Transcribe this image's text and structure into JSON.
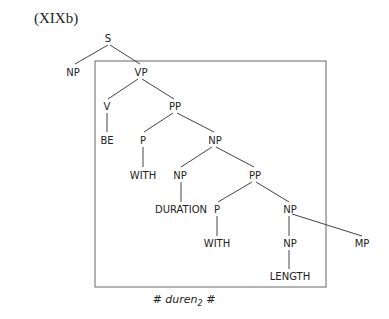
{
  "figure": {
    "label": "(XIXb)",
    "caption": {
      "prefix": "# duren",
      "subscript": "2",
      "suffix": " #"
    }
  },
  "tree": {
    "nodes": [
      {
        "id": "s",
        "label": "S"
      },
      {
        "id": "np1",
        "label": "NP"
      },
      {
        "id": "vp",
        "label": "VP"
      },
      {
        "id": "v",
        "label": "V"
      },
      {
        "id": "pp1",
        "label": "PP"
      },
      {
        "id": "be",
        "label": "BE"
      },
      {
        "id": "p1",
        "label": "P"
      },
      {
        "id": "np2",
        "label": "NP"
      },
      {
        "id": "with1",
        "label": "WITH"
      },
      {
        "id": "np3",
        "label": "NP"
      },
      {
        "id": "pp2",
        "label": "PP"
      },
      {
        "id": "duration",
        "label": "DURATION"
      },
      {
        "id": "p2",
        "label": "P"
      },
      {
        "id": "np4",
        "label": "NP"
      },
      {
        "id": "with2",
        "label": "WITH"
      },
      {
        "id": "np5",
        "label": "NP"
      },
      {
        "id": "mp",
        "label": "MP"
      },
      {
        "id": "length",
        "label": "LENGTH"
      }
    ]
  }
}
